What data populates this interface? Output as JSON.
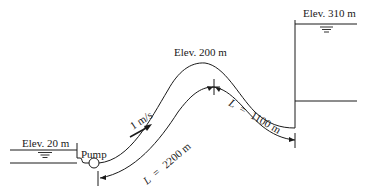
{
  "diagram": {
    "left_reservoir": {
      "elevation_label": "Elev. 20 m"
    },
    "pump": {
      "label": "Pump"
    },
    "right_reservoir": {
      "elevation_label": "Elev. 310 m"
    },
    "high_point": {
      "elevation_label": "Elev. 200 m"
    },
    "flow": {
      "velocity_label": "1 m/s"
    },
    "segment_1": {
      "length_var": "L",
      "length_eq": "=",
      "length_value": "2200 m"
    },
    "segment_2": {
      "length_var": "L",
      "length_eq": "=",
      "length_value": "1100 m"
    }
  },
  "colors": {
    "line": "#1a1a1a",
    "background": "#ffffff"
  }
}
